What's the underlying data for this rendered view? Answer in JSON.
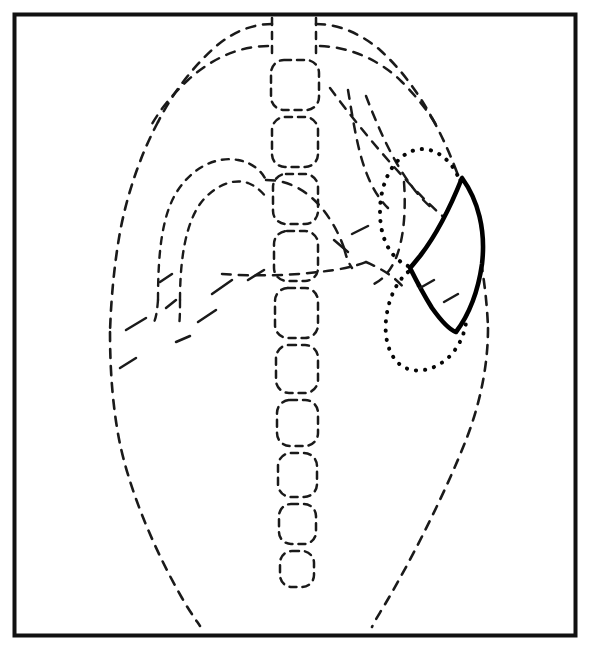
{
  "figure": {
    "title": "Chest radiograph schematic diagram",
    "background_color": "#ffffff",
    "ink_color": "#1a1a1a",
    "frame": {
      "name": "panel-border",
      "color": "#111111",
      "stroke_width": 4,
      "x": 13,
      "y": 13,
      "width": 563,
      "height": 623
    },
    "line_styles": {
      "body_outline": "dashed",
      "organ_outline": "dashed",
      "vertebrae": "dashed",
      "hilum": "dotted",
      "lesion": "solid"
    },
    "regions": [
      {
        "id": "body-outline",
        "label": "Thoracic body outline",
        "style": "dashed"
      },
      {
        "id": "thoracic-spine",
        "label": "Thoracic vertebral column",
        "style": "dashed",
        "vertebra_count": 11
      },
      {
        "id": "left-mediastinal-border",
        "label": "Aortic arch and left heart border",
        "style": "dashed"
      },
      {
        "id": "right-mediastinal-border",
        "label": "Right heart and mediastinal border",
        "style": "dashed"
      },
      {
        "id": "diaphragm-line",
        "label": "Diaphragm / cardiac base line",
        "style": "dashed"
      },
      {
        "id": "hilar-figure",
        "label": "Hilar / fissural dotted outline",
        "style": "dotted"
      },
      {
        "id": "lesion",
        "label": "Crescentic lesion outlined in solid black",
        "style": "solid",
        "fill": "#ffffff",
        "stroke": "#000000"
      }
    ]
  },
  "geometry": {
    "body_path": "M 283 22 C 240 26 196 54 168 105 C 138 160 120 238 114 318 C 110 392 112 470 122 520 C 133 572 160 608 196 628",
    "body_path_right": "M 325 22 C 374 28 420 58 448 108 C 478 162 494 232 494 296 C 494 366 472 444 440 508 C 418 552 396 594 378 628",
    "spine_left": "M 272 18 L 272 60",
    "spine_right": "M 315 18 L 315 60",
    "vertebrae": [
      {
        "x": 271,
        "y": 60,
        "w": 48,
        "h": 50,
        "r": 13
      },
      {
        "x": 272,
        "y": 117,
        "w": 46,
        "h": 50,
        "r": 13
      },
      {
        "x": 274,
        "y": 174,
        "w": 44,
        "h": 50,
        "r": 13
      },
      {
        "x": 275,
        "y": 231,
        "w": 43,
        "h": 50,
        "r": 13
      },
      {
        "x": 276,
        "y": 288,
        "w": 42,
        "h": 50,
        "r": 13
      },
      {
        "x": 277,
        "y": 345,
        "w": 41,
        "h": 48,
        "r": 13
      },
      {
        "x": 278,
        "y": 400,
        "w": 40,
        "h": 46,
        "r": 13
      },
      {
        "x": 278,
        "y": 453,
        "w": 39,
        "h": 44,
        "r": 13
      },
      {
        "x": 279,
        "y": 504,
        "w": 37,
        "h": 40,
        "r": 12
      },
      {
        "x": 280,
        "y": 551,
        "w": 34,
        "h": 36,
        "r": 12
      }
    ],
    "lesion_path": "M 462 178 C 452 204 438 232 424 256 C 414 272 404 282 412 268 L 412 268 C 404 278 418 300 432 318 C 442 330 450 334 456 330 C 470 312 480 286 482 256 C 484 226 476 198 462 178 Z",
    "lesion_apex": [
      462,
      178
    ],
    "lesion_waist": [
      410,
      268
    ],
    "lesion_base": [
      455,
      331
    ]
  }
}
